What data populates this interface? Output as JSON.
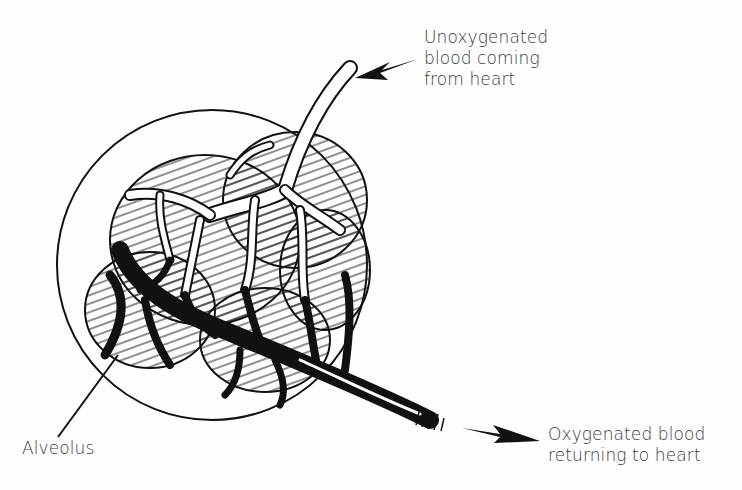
{
  "diagram": {
    "labels": {
      "unoxygenated": {
        "line1": "Unoxygenated",
        "line2": "blood coming",
        "line3": "from heart"
      },
      "oxygenated": {
        "line1": "Oxygenated blood",
        "line2": "returning to heart"
      },
      "alveolus": "Alveolus"
    },
    "colors": {
      "ink": "#111111",
      "text": "#3a3a3a",
      "background": "#fefefe"
    }
  }
}
